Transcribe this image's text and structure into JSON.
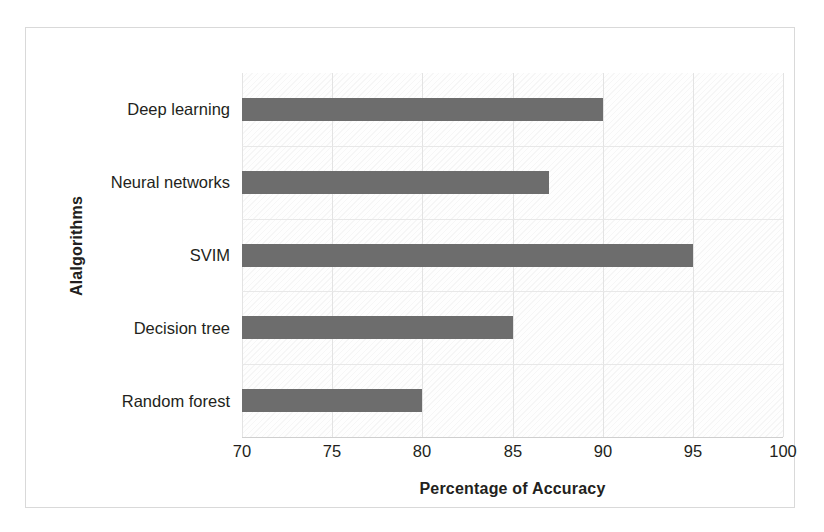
{
  "chart_data": {
    "type": "bar",
    "orientation": "horizontal",
    "title": "",
    "subtitle": "",
    "xlabel": "Percentage of Accuracy",
    "ylabel": "Alalgorithms",
    "categories": [
      "Random forest",
      "Decision tree",
      "SVIM",
      "Neural networks",
      "Deep learning"
    ],
    "values": [
      80,
      85,
      95,
      87,
      90
    ],
    "series": [
      {
        "name": "Percentage of Accuracy",
        "values": [
          80,
          85,
          95,
          87,
          90
        ]
      }
    ],
    "xlim": [
      70,
      100
    ],
    "xticks": [
      70,
      75,
      80,
      85,
      90,
      95,
      100
    ],
    "xtick_labels": [
      "70",
      "75",
      "80",
      "85",
      "90",
      "95",
      "100"
    ],
    "grid": "both",
    "legend": "none",
    "bar_color": "#6d6d6d",
    "plot_background": "#fefefe",
    "gridline_color": "#e3e3e3",
    "text_color": "#231f20"
  },
  "bars": [
    {
      "category": "Deep learning",
      "value": 90,
      "label": "Deep learning"
    },
    {
      "category": "Neural networks",
      "value": 87,
      "label": "Neural networks"
    },
    {
      "category": "SVIM",
      "value": 95,
      "label": "SVIM"
    },
    {
      "category": "Decision tree",
      "value": 85,
      "label": "Decision tree"
    },
    {
      "category": "Random forest",
      "value": 80,
      "label": "Random forest"
    }
  ],
  "axes": {
    "x_title": "Percentage of Accuracy",
    "y_title": "Alalgorithms",
    "x_ticks": [
      "70",
      "75",
      "80",
      "85",
      "90",
      "95",
      "100"
    ]
  }
}
